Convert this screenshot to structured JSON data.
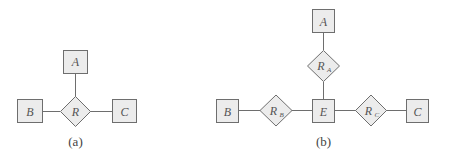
{
  "diagram_a": {
    "caption": "(a)",
    "entities": [
      {
        "id": "A",
        "label": "A"
      },
      {
        "id": "B",
        "label": "B"
      },
      {
        "id": "C",
        "label": "C"
      }
    ],
    "relationship": {
      "label": "R",
      "connects": [
        "A",
        "B",
        "C"
      ]
    }
  },
  "diagram_b": {
    "caption": "(b)",
    "entities": [
      {
        "id": "A",
        "label": "A"
      },
      {
        "id": "B",
        "label": "B"
      },
      {
        "id": "C",
        "label": "C"
      },
      {
        "id": "E",
        "label": "E"
      }
    ],
    "relationships": [
      {
        "label": "R",
        "subscript": "A",
        "connects": [
          "E",
          "A"
        ]
      },
      {
        "label": "R",
        "subscript": "B",
        "connects": [
          "E",
          "B"
        ]
      },
      {
        "label": "R",
        "subscript": "C",
        "connects": [
          "E",
          "C"
        ]
      }
    ]
  },
  "colors": {
    "fill": "#ececec",
    "stroke": "#6e6e6e",
    "text": "#555555"
  }
}
